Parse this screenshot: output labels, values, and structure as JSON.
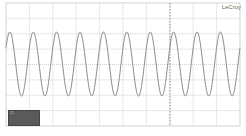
{
  "instrument": {
    "brand": "LeCroy",
    "type": "oscilloscope-display"
  },
  "grid": {
    "x0": 6,
    "x1": 240,
    "y0": 3,
    "y1": 126,
    "hdivs": 10,
    "vdivs": 8,
    "grid_color": "#d8d8d8",
    "border_color": "#c8c8c8",
    "center_line_color": "#b0b0b0",
    "trigger_line_x": 170,
    "trigger_line_color": "#777777"
  },
  "trace": {
    "color": "#8c8c8c",
    "center_y": 64,
    "amplitude_px": 32,
    "period_px": 23.4,
    "start_x": 6,
    "phase_offset_px": -2
  },
  "info_box": {
    "channel": "C1",
    "rows": [
      "",
      "",
      ""
    ]
  },
  "chart_data": {
    "type": "line",
    "title": "",
    "xlabel": "Time (divisions)",
    "ylabel": "Amplitude (normalized)",
    "xlim": [
      0,
      10
    ],
    "ylim": [
      -4,
      4
    ],
    "grid": true,
    "legend": [],
    "series": [
      {
        "name": "C1",
        "description": "Sinusoid, approx. 10 cycles across 10 horizontal divisions (1 cycle per division), amplitude approx. 2 divisions peak",
        "frequency_cycles_per_div": 1.0,
        "amplitude_div": 2.1,
        "offset_div": 0
      }
    ]
  }
}
